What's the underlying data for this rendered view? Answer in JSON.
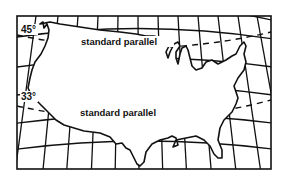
{
  "map": {
    "title": "",
    "projection": "conic with two standard parallels",
    "frame": {
      "x": 17,
      "y": 16,
      "width": 254,
      "height": 153
    },
    "colors": {
      "ink": "#111111",
      "background": "#ffffff"
    },
    "parallels": [
      {
        "degree_label": "45°",
        "name_label": "standard parallel",
        "style": "dashed"
      },
      {
        "degree_label": "33°",
        "name_label": "standard parallel",
        "style": "dashed"
      }
    ],
    "region": "Contiguous United States outline"
  }
}
